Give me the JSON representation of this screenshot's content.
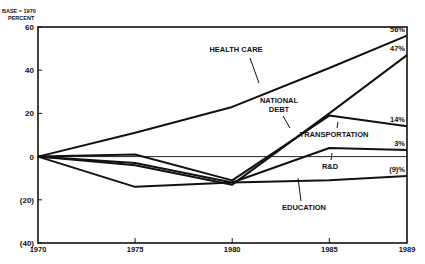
{
  "chart_data": {
    "type": "line",
    "title": "",
    "ylabel": "BASE = 1970 PERCENT",
    "ylabel_line1": "BASE = 1970",
    "ylabel_line2": "PERCENT",
    "xlabel": "",
    "x": [
      1970,
      1975,
      1980,
      1985,
      1989
    ],
    "x_tick_labels": [
      "1970",
      "1975",
      "1980",
      "1985",
      "1989"
    ],
    "y_ticks": [
      60,
      40,
      20,
      0,
      -20,
      -40
    ],
    "y_tick_labels": [
      "60",
      "40",
      "20",
      "0",
      "(20)",
      "(40)"
    ],
    "ylim": [
      -40,
      60
    ],
    "grid": false,
    "series": [
      {
        "name": "HEALTH CARE",
        "values": [
          0,
          11,
          23,
          41,
          56
        ],
        "end_label": "56%"
      },
      {
        "name": "NATIONAL DEBT",
        "values": [
          0,
          -4,
          -13,
          20,
          47
        ],
        "end_label": "47%"
      },
      {
        "name": "TRANSPORTATION",
        "values": [
          0,
          1,
          -11,
          19,
          14
        ],
        "end_label": "14%"
      },
      {
        "name": "R&D",
        "values": [
          0,
          -3,
          -12,
          4,
          3
        ],
        "end_label": "3%"
      },
      {
        "name": "EDUCATION",
        "values": [
          0,
          -14,
          -12,
          -11,
          -9
        ],
        "end_label": "(9)%"
      }
    ]
  },
  "labels": {
    "health_care": "HEALTH CARE",
    "national_debt_1": "NATIONAL",
    "national_debt_2": "DEBT",
    "transportation": "TRANSPORTATION",
    "rd": "R&D",
    "education": "EDUCATION"
  }
}
